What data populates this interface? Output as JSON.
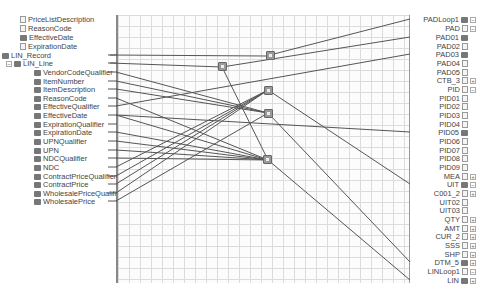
{
  "source_tree": {
    "items": [
      {
        "label": "PriceListDescription",
        "y": 19,
        "indent": 20,
        "type": "field"
      },
      {
        "label": "ReasonCode",
        "y": 28,
        "indent": 20,
        "type": "field"
      },
      {
        "label": "EffectiveDate",
        "y": 37,
        "indent": 20,
        "type": "record"
      },
      {
        "label": "ExpirationDate",
        "y": 46,
        "indent": 20,
        "type": "field"
      },
      {
        "label": "LIN_Record",
        "y": 55,
        "indent": 2,
        "type": "record"
      },
      {
        "label": "LIN_Line",
        "y": 63,
        "indent": 4,
        "type": "record",
        "expander": "−"
      },
      {
        "label": "VendorCodeQualifier",
        "y": 72,
        "indent": 34,
        "type": "record"
      },
      {
        "label": "ItemNumber",
        "y": 81,
        "indent": 34,
        "type": "record"
      },
      {
        "label": "ItemDescription",
        "y": 89,
        "indent": 34,
        "type": "record"
      },
      {
        "label": "ReasonCode",
        "y": 98,
        "indent": 34,
        "type": "record"
      },
      {
        "label": "EffectiveQualifier",
        "y": 106,
        "indent": 34,
        "type": "record"
      },
      {
        "label": "EffectiveDate",
        "y": 115,
        "indent": 34,
        "type": "record"
      },
      {
        "label": "ExpirationQualifier",
        "y": 124,
        "indent": 34,
        "type": "record"
      },
      {
        "label": "ExpirationDate",
        "y": 132,
        "indent": 34,
        "type": "record"
      },
      {
        "label": "UPNQualifier",
        "y": 141,
        "indent": 34,
        "type": "record"
      },
      {
        "label": "UPN",
        "y": 150,
        "indent": 34,
        "type": "record"
      },
      {
        "label": "NDCQualifier",
        "y": 158,
        "indent": 34,
        "type": "record"
      },
      {
        "label": "NDC",
        "y": 167,
        "indent": 34,
        "type": "record"
      },
      {
        "label": "ContractPriceQualifier",
        "y": 176,
        "indent": 34,
        "type": "record"
      },
      {
        "label": "ContractPrice",
        "y": 184,
        "indent": 34,
        "type": "record"
      },
      {
        "label": "WholesalePriceQualifier",
        "y": 193,
        "indent": 34,
        "type": "record"
      },
      {
        "label": "WholesalePrice",
        "y": 201,
        "indent": 34,
        "type": "record"
      }
    ]
  },
  "destination_tree": {
    "items": [
      {
        "label": "PADLoop1",
        "y": 19,
        "type": "record",
        "expander": "−"
      },
      {
        "label": "PAD",
        "y": 28,
        "type": "field",
        "expander": "−"
      },
      {
        "label": "PAD01",
        "y": 37,
        "type": "record"
      },
      {
        "label": "PAD02",
        "y": 46,
        "type": "field"
      },
      {
        "label": "PAD03",
        "y": 54,
        "type": "record"
      },
      {
        "label": "PAD04",
        "y": 63,
        "type": "field"
      },
      {
        "label": "PAD05",
        "y": 72,
        "type": "field"
      },
      {
        "label": "CTB_3",
        "y": 80,
        "type": "field",
        "expander": "+"
      },
      {
        "label": "PID",
        "y": 89,
        "type": "field",
        "expander": "−"
      },
      {
        "label": "PID01",
        "y": 98,
        "type": "field"
      },
      {
        "label": "PID02",
        "y": 106,
        "type": "field"
      },
      {
        "label": "PID03",
        "y": 115,
        "type": "field"
      },
      {
        "label": "PID04",
        "y": 124,
        "type": "field"
      },
      {
        "label": "PID05",
        "y": 132,
        "type": "record"
      },
      {
        "label": "PID06",
        "y": 141,
        "type": "field"
      },
      {
        "label": "PID07",
        "y": 150,
        "type": "field"
      },
      {
        "label": "PID08",
        "y": 158,
        "type": "field"
      },
      {
        "label": "PID09",
        "y": 167,
        "type": "field"
      },
      {
        "label": "MEA",
        "y": 176,
        "type": "field",
        "expander": "+"
      },
      {
        "label": "UIT",
        "y": 184,
        "type": "record",
        "expander": "−"
      },
      {
        "label": "C001_2",
        "y": 193,
        "type": "field",
        "expander": "+"
      },
      {
        "label": "UIT02",
        "y": 202,
        "type": "field"
      },
      {
        "label": "UIT03",
        "y": 210,
        "type": "field"
      },
      {
        "label": "QTY",
        "y": 219,
        "type": "field",
        "expander": "+"
      },
      {
        "label": "AMT",
        "y": 228,
        "type": "field",
        "expander": "+"
      },
      {
        "label": "CUR_2",
        "y": 236,
        "type": "field",
        "expander": "+"
      },
      {
        "label": "SSS",
        "y": 245,
        "type": "field",
        "expander": "+"
      },
      {
        "label": "SHP",
        "y": 254,
        "type": "field",
        "expander": "+"
      },
      {
        "label": "DTM_5",
        "y": 262,
        "type": "record",
        "expander": "+"
      },
      {
        "label": "LINLoop1",
        "y": 271,
        "type": "field",
        "expander": "−"
      },
      {
        "label": "LIN",
        "y": 280,
        "type": "record",
        "expander": "+"
      }
    ]
  },
  "functoids": [
    {
      "name": "functoid-a",
      "x": 266,
      "y": 51
    },
    {
      "name": "functoid-b",
      "x": 218,
      "y": 62
    },
    {
      "name": "functoid-c",
      "x": 264,
      "y": 86
    },
    {
      "name": "functoid-d",
      "x": 264,
      "y": 109
    },
    {
      "name": "functoid-e",
      "x": 263,
      "y": 155
    }
  ],
  "links": [
    [
      110,
      55,
      266,
      56
    ],
    [
      266,
      56,
      410,
      19
    ],
    [
      110,
      63,
      222,
      67
    ],
    [
      222,
      67,
      410,
      37
    ],
    [
      116,
      106,
      410,
      54
    ],
    [
      222,
      67,
      268,
      160
    ],
    [
      116,
      72,
      268,
      113
    ],
    [
      116,
      81,
      268,
      113
    ],
    [
      116,
      89,
      268,
      113
    ],
    [
      116,
      98,
      268,
      160
    ],
    [
      116,
      115,
      268,
      160
    ],
    [
      116,
      132,
      268,
      160
    ],
    [
      116,
      141,
      268,
      160
    ],
    [
      116,
      150,
      268,
      160
    ],
    [
      116,
      158,
      268,
      160
    ],
    [
      116,
      167,
      268,
      90
    ],
    [
      116,
      176,
      268,
      90
    ],
    [
      116,
      184,
      268,
      90
    ],
    [
      116,
      193,
      268,
      90
    ],
    [
      116,
      201,
      268,
      113
    ],
    [
      116,
      115,
      410,
      132
    ],
    [
      268,
      90,
      410,
      184
    ],
    [
      268,
      113,
      410,
      262
    ],
    [
      268,
      160,
      410,
      280
    ]
  ],
  "colors": {
    "link": "#555555",
    "grid_line": "#dcdcdc",
    "functoid": "#999999"
  }
}
